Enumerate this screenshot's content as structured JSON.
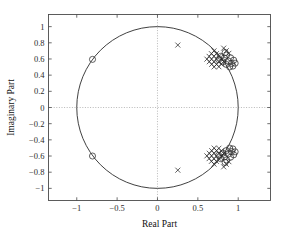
{
  "chart_data": {
    "type": "scatter",
    "title": "",
    "xlabel": "Real Part",
    "ylabel": "Imaginary Part",
    "xlim": [
      -1.35,
      1.4
    ],
    "ylim": [
      -1.15,
      1.15
    ],
    "xticks": [
      -1,
      -0.5,
      0,
      0.5,
      1
    ],
    "xticklabels": [
      "-1",
      "-0.5",
      "0",
      "0.5",
      "1"
    ],
    "yticks": [
      1,
      0.8,
      0.6,
      0.4,
      0.2,
      0,
      -0.2,
      -0.4,
      -0.6,
      -0.8,
      -1
    ],
    "yticklabels": [
      "1",
      "0.8",
      "0.6",
      "0.4",
      "0.2",
      "0",
      "-0.2",
      "-0.4",
      "-0.6",
      "-0.8",
      "-1"
    ],
    "grid": false,
    "reference_lines": [
      {
        "name": "zero-real-axis",
        "orientation": "horizontal",
        "value": 0,
        "style": "dotted"
      },
      {
        "name": "zero-imaginary-axis",
        "orientation": "vertical",
        "value": 0,
        "style": "dotted"
      }
    ],
    "unit_circle": {
      "center": [
        0,
        0
      ],
      "radius": 1
    },
    "series": [
      {
        "name": "zeros",
        "marker": "o",
        "points": [
          [
            -0.805,
            0.595
          ],
          [
            -0.805,
            -0.6
          ],
          [
            0.856,
            0.648
          ],
          [
            0.905,
            0.615
          ],
          [
            0.944,
            0.585
          ],
          [
            0.962,
            0.548
          ],
          [
            0.828,
            0.612
          ],
          [
            0.879,
            0.575
          ],
          [
            0.917,
            0.544
          ],
          [
            0.808,
            0.565
          ],
          [
            0.852,
            0.533
          ],
          [
            0.782,
            0.632
          ],
          [
            0.934,
            0.512
          ],
          [
            0.894,
            0.502
          ],
          [
            0.838,
            0.679
          ],
          [
            0.758,
            0.592
          ]
        ]
      },
      {
        "name": "poles",
        "marker": "x",
        "points": [
          [
            0.252,
            0.772
          ],
          [
            0.252,
            -0.775
          ],
          [
            0.7,
            0.7
          ],
          [
            0.73,
            0.666
          ],
          [
            0.762,
            0.632
          ],
          [
            0.793,
            0.6
          ],
          [
            0.668,
            0.666
          ],
          [
            0.7,
            0.634
          ],
          [
            0.73,
            0.6
          ],
          [
            0.762,
            0.568
          ],
          [
            0.64,
            0.632
          ],
          [
            0.67,
            0.598
          ],
          [
            0.7,
            0.566
          ],
          [
            0.732,
            0.534
          ],
          [
            0.612,
            0.598
          ],
          [
            0.642,
            0.566
          ],
          [
            0.672,
            0.534
          ],
          [
            0.702,
            0.502
          ],
          [
            0.82,
            0.568
          ],
          [
            0.79,
            0.536
          ],
          [
            0.76,
            0.504
          ],
          [
            0.852,
            0.702
          ],
          [
            0.82,
            0.734
          ],
          [
            0.884,
            0.67
          ],
          [
            0.7,
            -0.7
          ],
          [
            0.73,
            -0.666
          ],
          [
            0.762,
            -0.632
          ],
          [
            0.793,
            -0.6
          ],
          [
            0.668,
            -0.666
          ],
          [
            0.7,
            -0.634
          ],
          [
            0.73,
            -0.6
          ],
          [
            0.762,
            -0.568
          ],
          [
            0.64,
            -0.632
          ],
          [
            0.67,
            -0.598
          ],
          [
            0.7,
            -0.566
          ],
          [
            0.732,
            -0.534
          ],
          [
            0.612,
            -0.598
          ],
          [
            0.642,
            -0.566
          ],
          [
            0.672,
            -0.534
          ],
          [
            0.702,
            -0.502
          ],
          [
            0.82,
            -0.568
          ],
          [
            0.79,
            -0.536
          ],
          [
            0.76,
            -0.504
          ],
          [
            0.852,
            -0.702
          ],
          [
            0.82,
            -0.734
          ],
          [
            0.884,
            -0.67
          ]
        ]
      },
      {
        "name": "zeros-lower-cluster",
        "marker": "o",
        "points": [
          [
            0.856,
            -0.648
          ],
          [
            0.905,
            -0.615
          ],
          [
            0.944,
            -0.585
          ],
          [
            0.962,
            -0.548
          ],
          [
            0.828,
            -0.612
          ],
          [
            0.879,
            -0.575
          ],
          [
            0.917,
            -0.544
          ],
          [
            0.808,
            -0.565
          ],
          [
            0.852,
            -0.533
          ],
          [
            0.782,
            -0.632
          ],
          [
            0.934,
            -0.512
          ],
          [
            0.894,
            -0.502
          ],
          [
            0.838,
            -0.679
          ],
          [
            0.758,
            -0.592
          ]
        ]
      }
    ],
    "colors": {
      "marker": "#2b2b2b",
      "axis": "#4a4a4a",
      "reference_line": "#9a9a9a",
      "unit_circle": "#2b2b2b",
      "background": "#ffffff"
    }
  }
}
